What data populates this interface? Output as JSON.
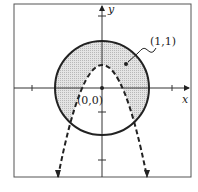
{
  "diagram": {
    "type": "graph-region",
    "axes": {
      "x_label": "x",
      "y_label": "y",
      "origin_label": "(0,0)"
    },
    "point_label": "(1,1)",
    "curves": [
      {
        "name": "circle",
        "style": "solid",
        "center": [
          0,
          0
        ]
      },
      {
        "name": "parabola",
        "style": "dashed",
        "opens": "down",
        "vertex": [
          0,
          1
        ]
      }
    ],
    "shaded_region": "inside circle and above parabola",
    "colors": {
      "stroke": "#222222",
      "shade": "#d9d9d9",
      "frame": "#555555"
    }
  }
}
